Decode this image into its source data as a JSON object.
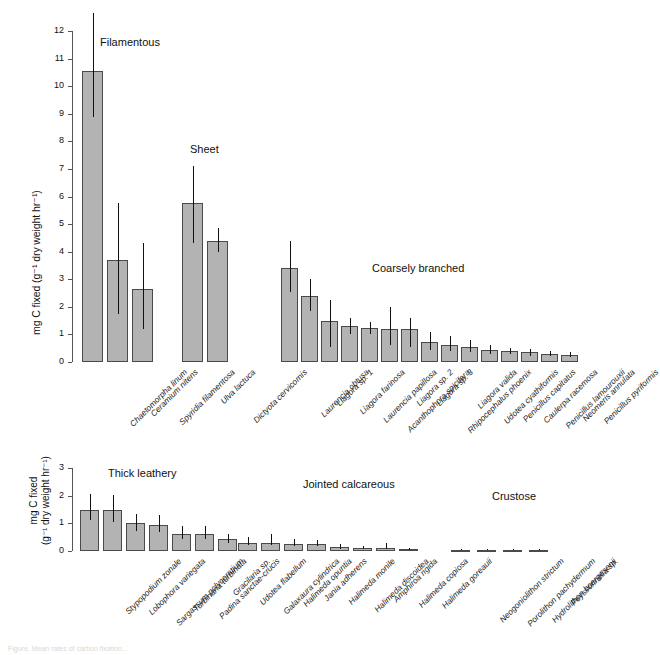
{
  "figure": {
    "caption_fragment": "Figure. Mean rates of carbon fixation..."
  },
  "chart_data": [
    {
      "type": "bar",
      "panel": "top",
      "title": "",
      "xlabel": "",
      "ylabel": "mg C fixed (g⁻¹ dry weight hr⁻¹)",
      "ylim": [
        0,
        12
      ],
      "yticks": [
        0,
        1,
        2,
        3,
        4,
        5,
        6,
        7,
        8,
        9,
        10,
        11,
        12
      ],
      "grid": false,
      "legend": "none",
      "errorbars": "range",
      "groups": [
        {
          "label": "Filamentous",
          "categories": [
            "Chaetomorpha linum",
            "Ceramium nitens",
            "Spyridia filamentosa"
          ],
          "values": [
            10.55,
            3.7,
            2.65
          ],
          "err_low": [
            8.9,
            1.75,
            1.2
          ],
          "err_high": [
            12.65,
            5.75,
            4.3
          ]
        },
        {
          "label": "Sheet",
          "categories": [
            "Ulva lactuca",
            "Dictyota cervicornis"
          ],
          "values": [
            5.75,
            4.4
          ],
          "err_low": [
            4.3,
            4.0
          ],
          "err_high": [
            7.1,
            4.85
          ]
        },
        {
          "label": "Coarsely branched",
          "categories": [
            "Laurencia obtusa",
            "Liagora sp. 1",
            "Liagora farinosa",
            "Laurencia papillosa",
            "Acanthophora spicifera",
            "Liagora sp. 2",
            "Liagora sp. 3",
            "Rhipocephalus phoenix",
            "Liagora valida",
            "Udotea cyathiformis",
            "Penicillus capitatus",
            "Caulerpa racemosa",
            "Penicillus lamourouxii",
            "Neomeris annulata",
            "Penicillus pyriformis"
          ],
          "values": [
            3.4,
            2.4,
            1.5,
            1.3,
            1.25,
            1.2,
            1.2,
            0.72,
            0.6,
            0.55,
            0.45,
            0.4,
            0.35,
            0.3,
            0.27
          ],
          "err_low": [
            2.55,
            1.85,
            0.55,
            1.0,
            1.0,
            0.62,
            0.55,
            0.45,
            0.4,
            0.38,
            0.3,
            0.28,
            0.22,
            0.2,
            0.18
          ],
          "err_high": [
            4.4,
            3.0,
            2.25,
            1.58,
            1.45,
            2.0,
            1.6,
            1.1,
            0.95,
            0.78,
            0.6,
            0.52,
            0.46,
            0.4,
            0.36
          ]
        }
      ]
    },
    {
      "type": "bar",
      "panel": "bottom",
      "title": "",
      "xlabel": "",
      "ylabel_line1": "mg C fixed",
      "ylabel_line2": "(g⁻¹ dry weight hr⁻¹)",
      "ylim": [
        0,
        3
      ],
      "yticks": [
        0,
        1,
        2,
        3
      ],
      "grid": false,
      "legend": "none",
      "errorbars": "range",
      "groups": [
        {
          "label": "Thick leathery",
          "categories": [
            "Stypopodium zonale",
            "Lobophora variegata",
            "Sargassum polyceratium",
            "Turbinaria turbinata",
            "Padina sanctae-crucis",
            "Gracilaria sp.",
            "Udotea flabellum"
          ],
          "values": [
            1.5,
            1.47,
            1.0,
            0.95,
            0.6,
            0.6,
            0.42
          ],
          "err_low": [
            1.12,
            1.05,
            0.72,
            0.68,
            0.42,
            0.42,
            0.3
          ],
          "err_high": [
            2.05,
            2.02,
            1.35,
            1.3,
            0.92,
            0.9,
            0.62
          ]
        },
        {
          "label": "Jointed calcareous",
          "categories": [
            "Galaxaura cylindrica",
            "Halimeda opuntia",
            "Jania adherens",
            "Halimeda monile",
            "Halimeda discoidea",
            "Amphiroa rigida",
            "Halimeda copiosa",
            "Halimeda goreauii"
          ],
          "values": [
            0.28,
            0.3,
            0.24,
            0.24,
            0.13,
            0.1,
            0.1,
            0.06
          ],
          "err_low": [
            0.2,
            0.2,
            0.17,
            0.17,
            0.09,
            0.07,
            0.07,
            0.04
          ],
          "err_high": [
            0.52,
            0.62,
            0.42,
            0.4,
            0.24,
            0.18,
            0.3,
            0.12
          ]
        },
        {
          "label": "Crustose",
          "categories": [
            "Neogoniolithon strictum",
            "Porolithon pachydermum",
            "Hydrolithon boergesenii",
            "Peyssonnelia sp."
          ],
          "values": [
            0.05,
            0.05,
            0.05,
            0.05
          ],
          "err_low": [
            0.03,
            0.03,
            0.03,
            0.03
          ],
          "err_high": [
            0.08,
            0.08,
            0.08,
            0.08
          ]
        }
      ]
    }
  ],
  "colors": {
    "bar_fill": "#b3b3b3",
    "bar_stroke": "#4a4a4a",
    "axis": "#555555",
    "text": "#111111"
  }
}
